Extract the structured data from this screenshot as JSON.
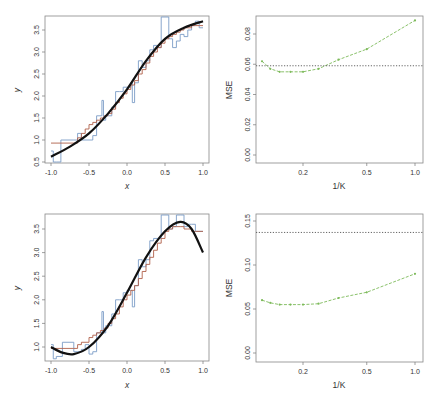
{
  "chart_data": [
    {
      "id": "top-left",
      "type": "line",
      "xlabel": "x",
      "ylabel": "y",
      "xlim": [
        -1.0,
        1.0
      ],
      "ylim": [
        0.5,
        3.75
      ],
      "xticks": [
        "-1.0",
        "-0.5",
        "0.0",
        "0.5",
        "1.0"
      ],
      "yticks": [
        "0.5",
        "1.0",
        "1.5",
        "2.0",
        "2.5",
        "3.0",
        "3.5"
      ],
      "series": [
        {
          "name": "true function",
          "color": "#111111",
          "style": "solid-thick",
          "x": [
            -1.0,
            -0.75,
            -0.5,
            -0.25,
            0.0,
            0.25,
            0.5,
            0.75,
            1.0
          ],
          "y": [
            0.62,
            0.85,
            1.15,
            1.6,
            2.15,
            2.8,
            3.3,
            3.55,
            3.7
          ]
        },
        {
          "name": "KNN fit K=1",
          "color": "#7a9cc6",
          "style": "step",
          "x": [
            -1.0,
            -0.97,
            -0.93,
            -0.87,
            -0.7,
            -0.65,
            -0.6,
            -0.5,
            -0.45,
            -0.4,
            -0.33,
            -0.31,
            -0.28,
            -0.2,
            -0.15,
            -0.1,
            -0.05,
            0.0,
            0.05,
            0.07,
            0.1,
            0.15,
            0.2,
            0.25,
            0.3,
            0.35,
            0.4,
            0.45,
            0.5,
            0.55,
            0.6,
            0.65,
            0.7,
            0.75,
            0.8,
            0.85,
            0.9,
            0.95,
            1.0
          ],
          "y": [
            0.75,
            0.5,
            0.5,
            1.0,
            1.0,
            1.15,
            1.0,
            1.0,
            1.1,
            1.55,
            1.9,
            1.45,
            1.55,
            1.75,
            2.1,
            2.1,
            2.2,
            2.2,
            2.3,
            1.85,
            2.3,
            2.8,
            2.65,
            2.8,
            3.05,
            3.15,
            3.1,
            3.8,
            3.8,
            3.3,
            3.1,
            3.25,
            3.4,
            3.35,
            3.5,
            3.6,
            3.7,
            3.55,
            3.55
          ]
        },
        {
          "name": "KNN fit K=9",
          "color": "#b0604a",
          "style": "step",
          "x": [
            -1.0,
            -0.7,
            -0.65,
            -0.6,
            -0.55,
            -0.5,
            -0.45,
            -0.4,
            -0.35,
            -0.3,
            -0.25,
            -0.2,
            -0.15,
            -0.1,
            -0.05,
            0.0,
            0.05,
            0.1,
            0.15,
            0.2,
            0.25,
            0.3,
            0.35,
            0.4,
            0.45,
            0.5,
            0.55,
            0.6,
            0.65,
            0.7,
            0.75,
            0.8,
            0.85,
            0.9,
            0.95,
            1.0
          ],
          "y": [
            0.93,
            0.93,
            1.05,
            1.15,
            1.25,
            1.35,
            1.4,
            1.45,
            1.5,
            1.55,
            1.6,
            1.7,
            1.85,
            1.95,
            2.05,
            2.15,
            2.25,
            2.35,
            2.5,
            2.6,
            2.75,
            2.9,
            3.0,
            3.1,
            3.2,
            3.3,
            3.35,
            3.4,
            3.45,
            3.5,
            3.55,
            3.55,
            3.6,
            3.6,
            3.6,
            3.6
          ]
        }
      ]
    },
    {
      "id": "top-right",
      "type": "line",
      "xlabel": "1/K",
      "ylabel": "MSE",
      "xscale": "log",
      "xlim": [
        0.1,
        1.05
      ],
      "ylim": [
        0.0,
        0.093
      ],
      "xticks": [
        "0.2",
        "0.5",
        "1.0"
      ],
      "yticks": [
        "0.00",
        "0.02",
        "0.04",
        "0.06",
        "0.08"
      ],
      "series": [
        {
          "name": "test MSE (KNN)",
          "color": "#7dba5a",
          "style": "dashed-points",
          "x": [
            0.111,
            0.125,
            0.143,
            0.167,
            0.2,
            0.25,
            0.333,
            0.5,
            1.0
          ],
          "y": [
            0.062,
            0.057,
            0.055,
            0.055,
            0.055,
            0.057,
            0.063,
            0.07,
            0.089
          ]
        },
        {
          "name": "linear regression MSE",
          "color": "#555555",
          "style": "dotted-hline",
          "y": 0.059
        }
      ]
    },
    {
      "id": "bottom-left",
      "type": "line",
      "xlabel": "x",
      "ylabel": "y",
      "xlim": [
        -1.0,
        1.0
      ],
      "ylim": [
        0.72,
        3.78
      ],
      "xticks": [
        "-1.0",
        "-0.5",
        "0.0",
        "0.5",
        "1.0"
      ],
      "yticks": [
        "1.0",
        "1.5",
        "2.0",
        "2.5",
        "3.0",
        "3.5"
      ],
      "series": [
        {
          "name": "true function",
          "color": "#111111",
          "style": "solid-thick",
          "x": [
            -1.0,
            -0.85,
            -0.7,
            -0.5,
            -0.25,
            0.0,
            0.25,
            0.5,
            0.7,
            0.85,
            1.0
          ],
          "y": [
            1.0,
            0.88,
            0.85,
            1.0,
            1.45,
            2.15,
            2.9,
            3.45,
            3.65,
            3.5,
            3.0
          ]
        },
        {
          "name": "KNN fit K=1",
          "color": "#7a9cc6",
          "style": "step",
          "x": [
            -1.0,
            -0.97,
            -0.93,
            -0.85,
            -0.7,
            -0.6,
            -0.55,
            -0.5,
            -0.45,
            -0.4,
            -0.33,
            -0.31,
            -0.28,
            -0.2,
            -0.15,
            -0.1,
            -0.05,
            0.0,
            0.05,
            0.07,
            0.1,
            0.15,
            0.2,
            0.25,
            0.3,
            0.35,
            0.4,
            0.45,
            0.5,
            0.55,
            0.6,
            0.65,
            0.7,
            0.75,
            0.8,
            0.85,
            0.9,
            1.0
          ],
          "y": [
            1.05,
            0.75,
            0.8,
            1.1,
            0.9,
            0.95,
            1.05,
            0.85,
            0.9,
            1.3,
            1.75,
            1.3,
            1.45,
            1.7,
            2.0,
            2.0,
            2.15,
            2.2,
            2.2,
            1.85,
            2.3,
            2.85,
            2.7,
            2.85,
            3.25,
            3.3,
            3.3,
            3.8,
            3.8,
            3.5,
            3.55,
            3.8,
            3.8,
            3.55,
            3.6,
            3.6,
            3.45,
            3.45
          ]
        },
        {
          "name": "KNN fit K=9",
          "color": "#b0604a",
          "style": "step",
          "x": [
            -1.0,
            -0.7,
            -0.65,
            -0.6,
            -0.5,
            -0.45,
            -0.4,
            -0.35,
            -0.3,
            -0.25,
            -0.2,
            -0.15,
            -0.1,
            -0.05,
            0.0,
            0.05,
            0.1,
            0.15,
            0.2,
            0.25,
            0.3,
            0.35,
            0.4,
            0.45,
            0.5,
            0.55,
            0.6,
            0.65,
            0.7,
            0.75,
            0.8,
            0.85,
            0.9,
            1.0
          ],
          "y": [
            0.97,
            0.97,
            1.05,
            1.1,
            1.2,
            1.25,
            1.3,
            1.35,
            1.4,
            1.5,
            1.6,
            1.7,
            1.85,
            2.0,
            2.1,
            2.2,
            2.3,
            2.45,
            2.6,
            2.75,
            2.9,
            3.05,
            3.2,
            3.3,
            3.45,
            3.5,
            3.55,
            3.55,
            3.55,
            3.5,
            3.5,
            3.45,
            3.45,
            3.45
          ]
        }
      ]
    },
    {
      "id": "bottom-right",
      "type": "line",
      "xlabel": "1/K",
      "ylabel": "MSE",
      "xscale": "log",
      "xlim": [
        0.1,
        1.05
      ],
      "ylim": [
        0.0,
        0.16
      ],
      "xticks": [
        "0.2",
        "0.5",
        "1.0"
      ],
      "yticks": [
        "0.00",
        "0.05",
        "0.10",
        "0.15"
      ],
      "series": [
        {
          "name": "test MSE (KNN)",
          "color": "#7dba5a",
          "style": "dashed-points",
          "x": [
            0.111,
            0.125,
            0.143,
            0.167,
            0.2,
            0.25,
            0.333,
            0.5,
            1.0
          ],
          "y": [
            0.06,
            0.057,
            0.055,
            0.055,
            0.055,
            0.056,
            0.0625,
            0.069,
            0.09
          ]
        },
        {
          "name": "linear regression MSE",
          "color": "#555555",
          "style": "dotted-hline",
          "y": 0.137
        }
      ]
    }
  ],
  "panels": {
    "top_left": {
      "xlabel": "x",
      "ylabel": "y"
    },
    "top_right": {
      "xlabel": "1/K",
      "ylabel": "MSE"
    },
    "bottom_left": {
      "xlabel": "x",
      "ylabel": "y"
    },
    "bottom_right": {
      "xlabel": "1/K",
      "ylabel": "MSE"
    }
  }
}
